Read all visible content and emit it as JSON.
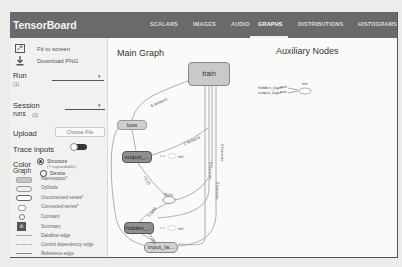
{
  "app": {
    "title": "TensorBoard"
  },
  "tabs": [
    {
      "label": "SCALARS",
      "active": false
    },
    {
      "label": "IMAGES",
      "active": false
    },
    {
      "label": "AUDIO",
      "active": false
    },
    {
      "label": "GRAPHS",
      "active": true
    },
    {
      "label": "DISTRIBUTIONS",
      "active": false
    },
    {
      "label": "HISTOGRAMS",
      "active": false
    }
  ],
  "sidebar": {
    "fit_to_screen": "Fit to screen",
    "download_png": "Download PNG",
    "run": {
      "label": "Run",
      "count": "(1)",
      "value": ""
    },
    "session_runs": {
      "label": "Session",
      "label2": "runs",
      "count": "(0)",
      "value": ""
    },
    "upload": {
      "label": "Upload",
      "button": "Choose File"
    },
    "trace_inputs": {
      "label": "Trace inputs",
      "enabled": false
    },
    "color": {
      "label": "Color",
      "label2": "Graph",
      "options": [
        {
          "label": "Structure",
          "sub": "(? expandable)",
          "selected": true
        },
        {
          "label": "Device",
          "selected": false
        }
      ]
    },
    "legend": [
      {
        "label": "Namespace*",
        "swatch": "namespace"
      },
      {
        "label": "OpNode",
        "swatch": "opnode"
      },
      {
        "label": "Unconnected series*",
        "swatch": "unconnected"
      },
      {
        "label": "Connected series*",
        "swatch": "connected"
      },
      {
        "label": "Constant",
        "swatch": "constant"
      },
      {
        "label": "Summary",
        "swatch": "summary"
      },
      {
        "label": "Dataflow edge",
        "swatch": "dataflow"
      },
      {
        "label": "Control dependency edge",
        "swatch": "control"
      },
      {
        "label": "Reference edge",
        "swatch": "reference"
      }
    ]
  },
  "main": {
    "main_graph_title": "Main Graph",
    "aux_title": "Auxiliary Nodes",
    "nodes": {
      "train": "train",
      "loss": "loss",
      "output": "output_...",
      "hidden": "hidden_...",
      "input": "input_la...",
      "relu": "Relu"
    },
    "edge_labels": {
      "train_loss": "6 tensors",
      "output_train": "2 tensors",
      "init_output": "init",
      "init_hidden": "init",
      "hidden_relu": "?×100",
      "output_relu": "?×10",
      "input_hidden": "?×784",
      "t1": "2 tensors",
      "t2": "2 tensors",
      "t3": "2 tensors"
    },
    "aux": {
      "rows": [
        "hidden_layer",
        "output_layer"
      ],
      "init": "init"
    }
  }
}
